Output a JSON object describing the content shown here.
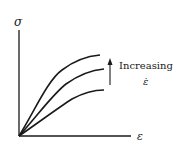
{
  "figure": {
    "y_axis_label": "σ",
    "x_axis_label": "ε",
    "annotation_text": "Increasing",
    "annotation_symbol": "ε̇",
    "line_color": "#1a1a1a",
    "background": "#ffffff"
  },
  "curves": [
    {
      "name": "low strain rate",
      "position": "bottom"
    },
    {
      "name": "medium strain rate",
      "position": "middle"
    },
    {
      "name": "high strain rate",
      "position": "top"
    }
  ]
}
